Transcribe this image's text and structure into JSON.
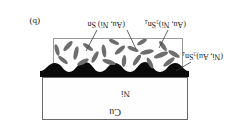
{
  "figure": {
    "panel_tag": "(b)",
    "orientation_note": "rotated-180",
    "layers": {
      "substrate_label": "Cu",
      "plating_label": "Ni"
    },
    "annotations": {
      "imc_scallop": "(Ni, Au)₃Sn₄",
      "particle_needle": "(Au, Ni)₃Sn₄",
      "particle_round": "(Au, Ni) Sn"
    },
    "colors": {
      "substrate_fill": "#fefefe",
      "substrate_border": "#6a6a6a",
      "plating": "#0a0a0a",
      "imc_scallop": "#0a0a0a",
      "particle": "#6d6d6d",
      "solder_fill": "#ffffff",
      "solder_border": "#9a9a9a",
      "text": "#1a1a1a"
    }
  }
}
